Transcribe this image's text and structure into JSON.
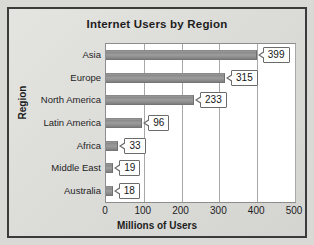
{
  "chart_data": {
    "type": "bar",
    "orientation": "horizontal",
    "title": "Internet Users by Region",
    "xlabel": "Millions of Users",
    "ylabel": "Region",
    "categories": [
      "Asia",
      "Europe",
      "North America",
      "Latin America",
      "Africa",
      "Middle East",
      "Australia"
    ],
    "values": [
      399,
      315,
      233,
      96,
      33,
      19,
      18
    ],
    "value_labels": [
      "399",
      "315",
      "233",
      "96",
      "33",
      "19",
      "18"
    ],
    "xlim": [
      0,
      500
    ],
    "xticks": [
      0,
      100,
      200,
      300,
      400,
      500
    ],
    "xtick_labels": [
      "0",
      "100",
      "200",
      "300",
      "400",
      "500"
    ],
    "grid": true,
    "grid_axis": "x",
    "legend": false,
    "series": [
      {
        "name": "Millions of Users",
        "values": [
          399,
          315,
          233,
          96,
          33,
          19,
          18
        ]
      }
    ],
    "colors": {
      "bar_fill": "#8f8f8f",
      "bar_edge": "#6f6f6f",
      "plot_background": "#ffffff",
      "chart_background": "#dededb",
      "frame_border": "#3b3b3b",
      "gridline": "#a8a8a8",
      "text": "#1d1d1d",
      "callout_border": "#6b6b6b",
      "callout_background": "#ffffff"
    }
  }
}
